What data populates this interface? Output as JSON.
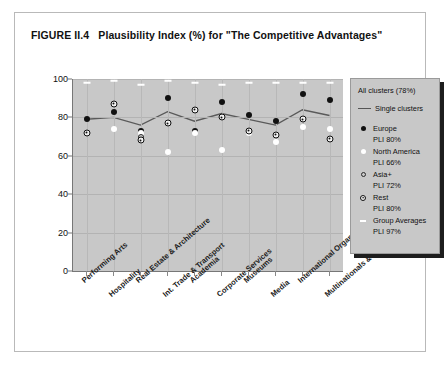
{
  "figure": {
    "label": "FIGURE II.4",
    "title": "Plausibility Index (%) for \"The Competitive Advantages\""
  },
  "legend": {
    "header": "All clusters (78%)",
    "line_label": "Single clusters",
    "entries": [
      {
        "name": "Europe",
        "pli": "PLI 80%",
        "marker": "filled-circle-icon"
      },
      {
        "name": "North America",
        "pli": "PLI 66%",
        "marker": "white-circle-icon"
      },
      {
        "name": "Asia+",
        "pli": "PLI 72%",
        "marker": "open-circle-icon"
      },
      {
        "name": "Rest",
        "pli": "PLI 80%",
        "marker": "dotted-circle-icon"
      },
      {
        "name": "Group Averages",
        "pli": "PLI 97%",
        "marker": "dash-icon"
      }
    ]
  },
  "chart_data": {
    "type": "scatter",
    "title": "Plausibility Index (%) for \"The Competitive Advantages\"",
    "xlabel": "",
    "ylabel": "",
    "ylim": [
      0,
      100
    ],
    "yticks": [
      0,
      20,
      40,
      60,
      80,
      100
    ],
    "grid": true,
    "legend_position": "right",
    "categories": [
      "Performing Arts",
      "Hospitality",
      "Real Estate & Architecture",
      "Int. Trade & Transport",
      "Academia",
      "Corporate Services",
      "Museums",
      "Media",
      "International Organizations",
      "Multinationals & Finance"
    ],
    "series": [
      {
        "name": "Europe",
        "values": [
          79,
          83,
          73,
          90,
          73,
          88,
          81,
          78,
          92,
          89
        ]
      },
      {
        "name": "North America",
        "values": [
          72,
          74,
          72,
          62,
          72,
          63,
          72,
          67,
          75,
          74
        ]
      },
      {
        "name": "Asia+",
        "values": [
          72,
          87,
          70,
          77,
          84,
          80,
          73,
          71,
          79,
          69
        ]
      },
      {
        "name": "Rest",
        "values": [
          72,
          87,
          68,
          77,
          84,
          80,
          73,
          71,
          79,
          69
        ]
      },
      {
        "name": "Group Averages",
        "values": [
          98,
          99,
          97,
          99,
          98,
          97,
          98,
          98,
          98,
          98
        ]
      },
      {
        "name": "Single clusters",
        "type": "line",
        "values": [
          79,
          80,
          76,
          83,
          78,
          82,
          79,
          76,
          84,
          81
        ]
      }
    ]
  }
}
